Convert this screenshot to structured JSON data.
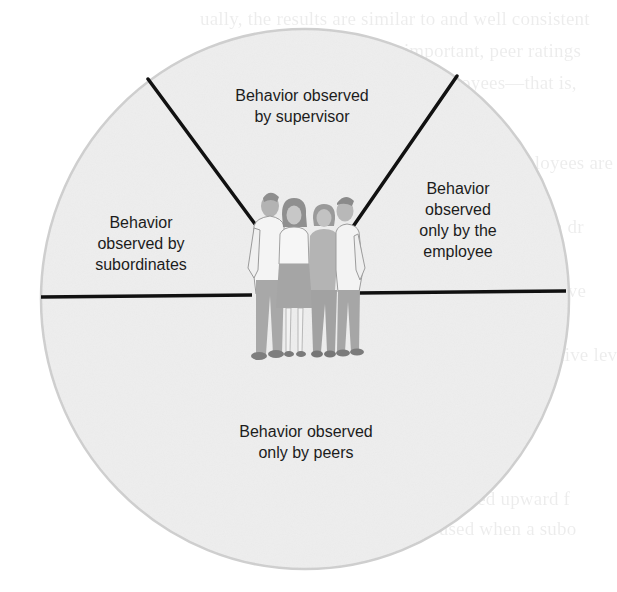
{
  "diagram": {
    "type": "sector-diagram",
    "colors": {
      "circle_fill": "#efefef",
      "circle_edge": "#c9c9c9",
      "divider_lines": "#111111",
      "label_text": "#1c1c1c",
      "figure_gray": "#a9a9a9"
    },
    "regions": [
      {
        "id": "supervisor",
        "lines": [
          "Behavior observed",
          "by supervisor"
        ]
      },
      {
        "id": "employee",
        "lines": [
          "Behavior",
          "observed",
          "only by the",
          "employee"
        ]
      },
      {
        "id": "subordinates",
        "lines": [
          "Behavior",
          "observed by",
          "subordinates"
        ]
      },
      {
        "id": "peers",
        "lines": [
          "Behavior observed",
          "only by peers"
        ]
      }
    ],
    "center_figure": {
      "label": "group of four people",
      "count": 4
    }
  },
  "background_bleedthrough": {
    "legible": false,
    "fragments": [
      "ually, the results are similar to and well consistent",
      "Wanous, 1988). Most important, peer ratings",
      "ful success of groups of employees—that is,",
      "Anderson, 1979).",
      "Research suggests that certain employees are",
      "by peers or by employers and Swift",
      "evaluating their own performance. Certain dr",
      "more appropriate: Using peers as rating op",
      "certain employees who appear more sensitive",
      "less productive or the longer peers than t",
      "employees rate their own overall comparative lev",
      "(Albright & Levy, 1995).",
      "Subordinates",
      "Subordinate feedback (also called upward f",
      "of 360-degree feedback is used when a subo"
    ]
  }
}
